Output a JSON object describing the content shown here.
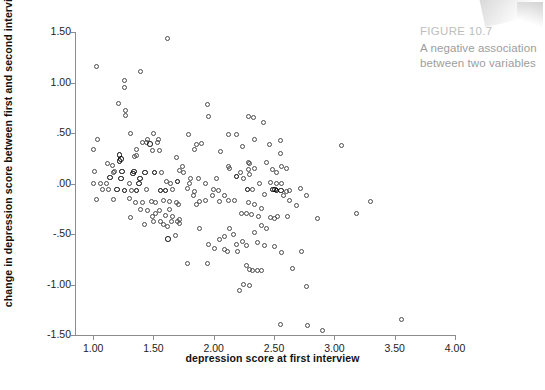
{
  "figure": {
    "caption_title": "FIGURE 10.7",
    "caption_line1": "A negative association",
    "caption_line2": "between two variables"
  },
  "chart_data": {
    "type": "scatter",
    "title": "",
    "xlabel": "depression score at first interview",
    "ylabel": "change in depression score between first and second interview",
    "xlim": [
      0.85,
      4.0
    ],
    "ylim": [
      -1.5,
      1.5
    ],
    "xticks": [
      "1.00",
      "1.50",
      "2.00",
      "2.50",
      "3.00",
      "3.50",
      "4.00"
    ],
    "xtick_values": [
      1.0,
      1.5,
      2.0,
      2.5,
      3.0,
      3.5,
      4.0
    ],
    "yticks": [
      "1.50",
      "1.00",
      ".50",
      ".00",
      "-.50",
      "-1.00",
      "-1.50"
    ],
    "ytick_values": [
      1.5,
      1.0,
      0.5,
      0.0,
      -0.5,
      -1.0,
      -1.5
    ],
    "grid": false,
    "legend": null,
    "marker": "open-circle",
    "marker_color": "#4a4a4a",
    "association": "negative",
    "n_points": 203,
    "points": [
      [
        1.03,
        1.16
      ],
      [
        1.62,
        1.44
      ],
      [
        1.39,
        1.11
      ],
      [
        1.26,
        1.02
      ],
      [
        1.26,
        0.95
      ],
      [
        1.21,
        0.79
      ],
      [
        1.95,
        0.78
      ],
      [
        1.27,
        0.72
      ],
      [
        1.27,
        0.67
      ],
      [
        2.29,
        0.66
      ],
      [
        2.33,
        0.65
      ],
      [
        1.96,
        0.66
      ],
      [
        2.41,
        0.6
      ],
      [
        1.31,
        0.5
      ],
      [
        1.5,
        0.5
      ],
      [
        1.79,
        0.49
      ],
      [
        2.12,
        0.49
      ],
      [
        2.19,
        0.49
      ],
      [
        1.04,
        0.44
      ],
      [
        1.54,
        0.44
      ],
      [
        1.53,
        0.41
      ],
      [
        2.34,
        0.44
      ],
      [
        2.55,
        0.43
      ],
      [
        1.0,
        0.34
      ],
      [
        1.41,
        0.41
      ],
      [
        1.44,
        0.41
      ],
      [
        1.47,
        0.39
      ],
      [
        1.9,
        0.4
      ],
      [
        1.86,
        0.39
      ],
      [
        2.46,
        0.39
      ],
      [
        3.06,
        0.38
      ],
      [
        1.22,
        0.28
      ],
      [
        1.36,
        0.28
      ],
      [
        1.34,
        0.27
      ],
      [
        1.23,
        0.24
      ],
      [
        1.55,
        0.33
      ],
      [
        1.84,
        0.34
      ],
      [
        2.24,
        0.37
      ],
      [
        1.12,
        0.2
      ],
      [
        1.16,
        0.18
      ],
      [
        1.69,
        0.26
      ],
      [
        2.06,
        0.32
      ],
      [
        2.55,
        0.3
      ],
      [
        1.22,
        0.22
      ],
      [
        1.24,
        0.12
      ],
      [
        1.34,
        0.12
      ],
      [
        1.51,
        0.11
      ],
      [
        1.74,
        0.17
      ],
      [
        2.12,
        0.17
      ],
      [
        2.29,
        0.21
      ],
      [
        2.3,
        0.2
      ],
      [
        2.56,
        0.17
      ],
      [
        1.01,
        0.12
      ],
      [
        1.17,
        0.11
      ],
      [
        1.33,
        0.1
      ],
      [
        1.72,
        0.13
      ],
      [
        1.75,
        0.11
      ],
      [
        2.13,
        0.15
      ],
      [
        2.29,
        0.14
      ],
      [
        2.34,
        0.15
      ],
      [
        2.49,
        0.14
      ],
      [
        2.52,
        0.11
      ],
      [
        1.23,
        0.05
      ],
      [
        1.39,
        0.05
      ],
      [
        1.61,
        0.02
      ],
      [
        1.7,
        0.02
      ],
      [
        1.87,
        0.05
      ],
      [
        2.02,
        0.05
      ],
      [
        2.19,
        0.07
      ],
      [
        2.3,
        0.09
      ],
      [
        1.0,
        0.0
      ],
      [
        1.06,
        0.0
      ],
      [
        1.11,
        0.0
      ],
      [
        1.3,
        0.0
      ],
      [
        1.38,
        0.0
      ],
      [
        1.64,
        0.0
      ],
      [
        1.8,
        0.0
      ],
      [
        1.93,
        0.0
      ],
      [
        2.38,
        0.0
      ],
      [
        2.52,
        0.0
      ],
      [
        2.56,
        0.0
      ],
      [
        1.08,
        -0.06
      ],
      [
        1.13,
        -0.06
      ],
      [
        1.2,
        -0.06
      ],
      [
        1.26,
        -0.07
      ],
      [
        1.32,
        -0.07
      ],
      [
        1.36,
        -0.07
      ],
      [
        1.44,
        -0.06
      ],
      [
        1.56,
        -0.07
      ],
      [
        1.6,
        -0.07
      ],
      [
        1.66,
        -0.06
      ],
      [
        1.78,
        -0.05
      ],
      [
        1.84,
        -0.08
      ],
      [
        2.0,
        -0.06
      ],
      [
        2.04,
        -0.07
      ],
      [
        2.28,
        -0.06
      ],
      [
        2.32,
        -0.06
      ],
      [
        2.52,
        -0.07
      ],
      [
        2.56,
        -0.07
      ],
      [
        2.6,
        -0.08
      ],
      [
        2.72,
        -0.05
      ],
      [
        1.03,
        -0.16
      ],
      [
        1.17,
        -0.16
      ],
      [
        1.3,
        -0.15
      ],
      [
        1.35,
        -0.19
      ],
      [
        1.41,
        -0.19
      ],
      [
        1.48,
        -0.18
      ],
      [
        1.52,
        -0.19
      ],
      [
        1.58,
        -0.17
      ],
      [
        1.63,
        -0.18
      ],
      [
        1.69,
        -0.19
      ],
      [
        1.83,
        -0.12
      ],
      [
        1.88,
        -0.18
      ],
      [
        1.93,
        -0.17
      ],
      [
        2.05,
        -0.18
      ],
      [
        2.12,
        -0.17
      ],
      [
        2.17,
        -0.17
      ],
      [
        2.29,
        -0.19
      ],
      [
        2.42,
        -0.11
      ],
      [
        2.58,
        -0.12
      ],
      [
        2.63,
        -0.17
      ],
      [
        2.69,
        -0.22
      ],
      [
        2.77,
        -0.12
      ],
      [
        3.18,
        -0.3
      ],
      [
        3.3,
        -0.18
      ],
      [
        1.31,
        -0.34
      ],
      [
        1.39,
        -0.26
      ],
      [
        1.45,
        -0.27
      ],
      [
        1.49,
        -0.33
      ],
      [
        1.52,
        -0.3
      ],
      [
        1.55,
        -0.27
      ],
      [
        1.6,
        -0.32
      ],
      [
        1.63,
        -0.26
      ],
      [
        1.66,
        -0.33
      ],
      [
        1.72,
        -0.36
      ],
      [
        1.5,
        -0.38
      ],
      [
        1.56,
        -0.38
      ],
      [
        1.65,
        -0.38
      ],
      [
        1.7,
        -0.38
      ],
      [
        2.23,
        -0.3
      ],
      [
        2.27,
        -0.3
      ],
      [
        2.31,
        -0.31
      ],
      [
        2.4,
        -0.25
      ],
      [
        2.37,
        -0.33
      ],
      [
        2.47,
        -0.34
      ],
      [
        2.5,
        -0.35
      ],
      [
        2.53,
        -0.33
      ],
      [
        2.61,
        -0.33
      ],
      [
        2.86,
        -0.35
      ],
      [
        1.43,
        -0.41
      ],
      [
        1.58,
        -0.41
      ],
      [
        1.62,
        -0.43
      ],
      [
        1.72,
        -0.4
      ],
      [
        1.88,
        -0.45
      ],
      [
        2.13,
        -0.45
      ],
      [
        2.4,
        -0.42
      ],
      [
        2.44,
        -0.45
      ],
      [
        2.34,
        -0.49
      ],
      [
        1.62,
        -0.55
      ],
      [
        1.68,
        -0.51
      ],
      [
        2.05,
        -0.55
      ],
      [
        2.09,
        -0.52
      ],
      [
        2.16,
        -0.5
      ],
      [
        2.24,
        -0.57
      ],
      [
        2.36,
        -0.58
      ],
      [
        1.96,
        -0.6
      ],
      [
        2.01,
        -0.64
      ],
      [
        2.09,
        -0.65
      ],
      [
        2.19,
        -0.6
      ],
      [
        2.27,
        -0.61
      ],
      [
        2.42,
        -0.61
      ],
      [
        2.5,
        -0.62
      ],
      [
        2.11,
        -0.67
      ],
      [
        2.2,
        -0.67
      ],
      [
        2.56,
        -0.68
      ],
      [
        2.73,
        -0.67
      ],
      [
        1.78,
        -0.79
      ],
      [
        1.95,
        -0.79
      ],
      [
        2.27,
        -0.81
      ],
      [
        2.3,
        -0.85
      ],
      [
        2.32,
        -0.86
      ],
      [
        2.36,
        -0.86
      ],
      [
        2.4,
        -0.86
      ],
      [
        2.65,
        -0.84
      ],
      [
        2.21,
        -1.06
      ],
      [
        2.25,
        -1.0
      ],
      [
        2.3,
        -1.01
      ],
      [
        2.77,
        -1.02
      ],
      [
        2.55,
        -1.4
      ],
      [
        2.78,
        -1.41
      ],
      [
        2.9,
        -1.46
      ],
      [
        3.56,
        -1.35
      ],
      [
        1.45,
        0.44
      ],
      [
        1.49,
        0.33
      ],
      [
        1.18,
        0.12
      ],
      [
        1.14,
        0.06
      ],
      [
        1.57,
        0.11
      ],
      [
        1.81,
        0.05
      ],
      [
        1.99,
        -0.12
      ],
      [
        2.22,
        0.11
      ],
      [
        2.25,
        0.05
      ],
      [
        2.44,
        0.21
      ],
      [
        2.47,
        0.01
      ],
      [
        2.6,
        0.15
      ],
      [
        2.63,
        -0.07
      ],
      [
        1.36,
        0.34
      ],
      [
        1.43,
        0.11
      ],
      [
        1.71,
        -0.21
      ],
      [
        1.86,
        -0.21
      ],
      [
        2.09,
        -0.12
      ],
      [
        2.34,
        -0.21
      ],
      [
        2.49,
        -0.06
      ],
      [
        2.51,
        -0.06
      ]
    ],
    "bold_points": [
      [
        1.22,
        0.28
      ],
      [
        1.23,
        0.24
      ],
      [
        1.22,
        0.22
      ],
      [
        1.24,
        0.12
      ],
      [
        1.23,
        0.05
      ],
      [
        1.2,
        -0.06
      ],
      [
        1.26,
        -0.07
      ],
      [
        1.34,
        0.12
      ],
      [
        1.33,
        0.1
      ],
      [
        1.36,
        -0.07
      ],
      [
        1.39,
        0.05
      ],
      [
        1.38,
        0.0
      ],
      [
        1.51,
        0.11
      ],
      [
        1.47,
        0.39
      ],
      [
        1.56,
        -0.07
      ],
      [
        1.6,
        -0.07
      ],
      [
        1.62,
        -0.55
      ],
      [
        1.7,
        0.02
      ],
      [
        2.19,
        0.07
      ],
      [
        2.28,
        -0.06
      ],
      [
        2.52,
        -0.07
      ],
      [
        2.56,
        -0.07
      ],
      [
        1.14,
        0.06
      ],
      [
        1.43,
        0.11
      ],
      [
        2.49,
        -0.06
      ],
      [
        2.51,
        -0.06
      ]
    ]
  }
}
